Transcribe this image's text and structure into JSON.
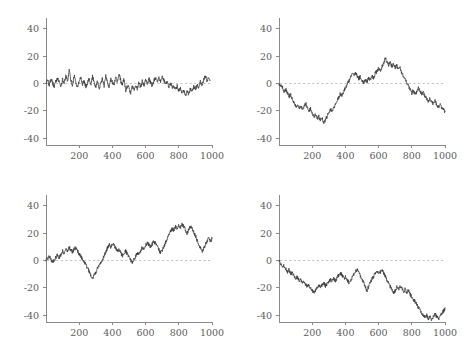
{
  "figure": {
    "background_color": "#ffffff",
    "layout": "2x2",
    "panel_count": 4
  },
  "style": {
    "axis_color": "#8a8a8a",
    "line_color": "#3b3b3b",
    "zero_line_color": "#b9b3b3",
    "tick_label_color": "#5d5d5d"
  },
  "chart_data": [
    {
      "type": "line",
      "title": "",
      "xlabel": "",
      "ylabel": "",
      "xlim": [
        0,
        1000
      ],
      "ylim": [
        -45,
        45
      ],
      "xticks": [
        200,
        400,
        600,
        800,
        1000
      ],
      "yticks": [
        -40,
        -20,
        0,
        20,
        40
      ],
      "xticklabels": [
        "200",
        "400",
        "600",
        "800",
        "1000"
      ],
      "yticklabels": [
        "-40",
        "-20",
        "0",
        "20",
        "40"
      ],
      "grid": false,
      "legend": false,
      "reference_line": {
        "y": 0,
        "style": "dashed"
      },
      "panel": "top-left",
      "description": "stationary white-noise-like series oscillating about zero",
      "series": [
        {
          "name": "series-1",
          "x": [
            0,
            10,
            20,
            30,
            40,
            50,
            60,
            70,
            80,
            90,
            100,
            110,
            120,
            130,
            140,
            150,
            160,
            170,
            180,
            190,
            200,
            210,
            220,
            230,
            240,
            250,
            260,
            270,
            280,
            290,
            300,
            310,
            320,
            330,
            340,
            350,
            360,
            370,
            380,
            390,
            400,
            410,
            420,
            430,
            440,
            450,
            460,
            470,
            480,
            490,
            500,
            510,
            520,
            530,
            540,
            550,
            560,
            570,
            580,
            590,
            600,
            610,
            620,
            630,
            640,
            650,
            660,
            670,
            680,
            690,
            700,
            710,
            720,
            730,
            740,
            750,
            760,
            770,
            780,
            790,
            800,
            810,
            820,
            830,
            840,
            850,
            860,
            870,
            880,
            890,
            900,
            910,
            920,
            930,
            940,
            950,
            960,
            970,
            980,
            990,
            1000
          ],
          "values": [
            0.5,
            2.2,
            -1.0,
            3.4,
            0.3,
            -2.1,
            1.8,
            4.2,
            0.9,
            -1.6,
            2.7,
            0.4,
            5.1,
            1.2,
            9.8,
            2.3,
            -1.4,
            6.2,
            0.6,
            -3.2,
            1.9,
            4.6,
            -0.8,
            2.1,
            -2.5,
            0.7,
            3.8,
            -1.2,
            4.9,
            1.5,
            -2.8,
            2.4,
            -4.1,
            0.2,
            3.1,
            -1.9,
            5.2,
            1.0,
            -2.2,
            3.6,
            0.8,
            -1.5,
            4.4,
            1.3,
            6.8,
            2.0,
            -0.9,
            3.3,
            -5.6,
            -1.8,
            -3.4,
            -6.9,
            -2.1,
            -4.8,
            -1.1,
            -3.7,
            0.4,
            -2.6,
            1.7,
            -1.3,
            2.9,
            -0.5,
            3.4,
            1.1,
            -1.7,
            2.2,
            4.3,
            0.6,
            3.9,
            1.4,
            5.0,
            2.6,
            -0.7,
            1.8,
            -2.4,
            0.3,
            -3.1,
            -1.6,
            -4.2,
            -2.0,
            -5.4,
            -3.3,
            -7.1,
            -4.6,
            -9.4,
            -5.2,
            -8.0,
            -3.8,
            -6.1,
            -2.3,
            -4.4,
            -0.9,
            -2.7,
            1.2,
            -1.4,
            3.0,
            5.8,
            1.9,
            4.1,
            0.7
          ]
        }
      ]
    },
    {
      "type": "line",
      "title": "",
      "xlabel": "",
      "ylabel": "",
      "xlim": [
        0,
        1000
      ],
      "ylim": [
        -45,
        45
      ],
      "xticks": [
        200,
        400,
        600,
        800,
        1000
      ],
      "yticks": [
        -40,
        -20,
        0,
        20,
        40
      ],
      "xticklabels": [
        "200",
        "400",
        "600",
        "800",
        "1000"
      ],
      "yticklabels": [
        "-40",
        "-20",
        "0",
        "20",
        "40"
      ],
      "grid": false,
      "legend": false,
      "reference_line": {
        "y": 0,
        "style": "dashed"
      },
      "panel": "top-right",
      "description": "random walk: dips to about -28 near x=250, rises to about +19 near x=640, ends near -20",
      "series": [
        {
          "name": "series-2",
          "x": [
            0,
            10,
            20,
            30,
            40,
            50,
            60,
            70,
            80,
            90,
            100,
            110,
            120,
            130,
            140,
            150,
            160,
            170,
            180,
            190,
            200,
            210,
            220,
            230,
            240,
            250,
            260,
            270,
            280,
            290,
            300,
            310,
            320,
            330,
            340,
            350,
            360,
            370,
            380,
            390,
            400,
            410,
            420,
            430,
            440,
            450,
            460,
            470,
            480,
            490,
            500,
            510,
            520,
            530,
            540,
            550,
            560,
            570,
            580,
            590,
            600,
            610,
            620,
            630,
            640,
            650,
            660,
            670,
            680,
            690,
            700,
            710,
            720,
            730,
            740,
            750,
            760,
            770,
            780,
            790,
            800,
            810,
            820,
            830,
            840,
            850,
            860,
            870,
            880,
            890,
            900,
            910,
            920,
            930,
            940,
            950,
            960,
            970,
            980,
            990,
            1000
          ],
          "values": [
            0.0,
            -1.5,
            -3.0,
            -5.5,
            -4.2,
            -7.0,
            -9.5,
            -8.2,
            -11.0,
            -13.5,
            -17.0,
            -15.2,
            -18.5,
            -16.0,
            -19.5,
            -17.2,
            -14.5,
            -16.8,
            -20.0,
            -18.5,
            -22.0,
            -24.5,
            -22.8,
            -26.0,
            -24.0,
            -27.0,
            -25.5,
            -28.5,
            -26.5,
            -24.0,
            -21.5,
            -19.0,
            -20.5,
            -17.5,
            -15.0,
            -12.5,
            -10.0,
            -7.5,
            -8.8,
            -5.5,
            -3.0,
            -1.0,
            1.5,
            4.0,
            7.0,
            5.5,
            8.5,
            6.0,
            3.5,
            5.0,
            2.0,
            0.5,
            3.0,
            1.0,
            4.5,
            2.5,
            6.0,
            4.0,
            7.5,
            9.0,
            11.0,
            9.5,
            12.5,
            15.0,
            18.5,
            16.0,
            13.5,
            15.5,
            12.0,
            14.0,
            11.5,
            13.0,
            10.0,
            11.5,
            8.0,
            5.5,
            3.0,
            0.5,
            -2.0,
            -4.5,
            -7.0,
            -5.0,
            -8.5,
            -6.0,
            -3.5,
            -5.5,
            -8.0,
            -6.5,
            -9.5,
            -11.5,
            -13.0,
            -11.0,
            -13.5,
            -15.0,
            -13.0,
            -15.5,
            -17.0,
            -15.5,
            -17.5,
            -19.0,
            -20.5
          ]
        }
      ]
    },
    {
      "type": "line",
      "title": "",
      "xlabel": "",
      "ylabel": "",
      "xlim": [
        0,
        1000
      ],
      "ylim": [
        -45,
        45
      ],
      "xticks": [
        200,
        400,
        600,
        800,
        1000
      ],
      "yticks": [
        -40,
        -20,
        0,
        20,
        40
      ],
      "xticklabels": [
        "200",
        "400",
        "600",
        "800",
        "1000"
      ],
      "yticklabels": [
        "-40",
        "-20",
        "0",
        "20",
        "40"
      ],
      "grid": false,
      "legend": false,
      "reference_line": {
        "y": 0,
        "style": "dashed"
      },
      "panel": "bottom-left",
      "description": "upward-drifting random walk: dips to about -13 near x=250, peaks near +27 around x=820, ends near +16",
      "series": [
        {
          "name": "series-3",
          "x": [
            0,
            10,
            20,
            30,
            40,
            50,
            60,
            70,
            80,
            90,
            100,
            110,
            120,
            130,
            140,
            150,
            160,
            170,
            180,
            190,
            200,
            210,
            220,
            230,
            240,
            250,
            260,
            270,
            280,
            290,
            300,
            310,
            320,
            330,
            340,
            350,
            360,
            370,
            380,
            390,
            400,
            410,
            420,
            430,
            440,
            450,
            460,
            470,
            480,
            490,
            500,
            510,
            520,
            530,
            540,
            550,
            560,
            570,
            580,
            590,
            600,
            610,
            620,
            630,
            640,
            650,
            660,
            670,
            680,
            690,
            700,
            710,
            720,
            730,
            740,
            750,
            760,
            770,
            780,
            790,
            800,
            810,
            820,
            830,
            840,
            850,
            860,
            870,
            880,
            890,
            900,
            910,
            920,
            930,
            940,
            950,
            960,
            970,
            980,
            990,
            1000
          ],
          "values": [
            0.0,
            1.5,
            3.0,
            1.0,
            -1.5,
            0.5,
            2.5,
            4.0,
            2.0,
            4.5,
            7.0,
            5.5,
            8.5,
            7.0,
            9.5,
            8.0,
            6.0,
            8.5,
            9.5,
            7.0,
            5.0,
            3.0,
            1.0,
            -1.0,
            -3.0,
            -5.5,
            -8.0,
            -10.5,
            -13.0,
            -11.0,
            -8.5,
            -6.0,
            -4.0,
            -1.5,
            1.0,
            3.5,
            6.0,
            9.0,
            11.5,
            10.0,
            12.5,
            11.0,
            9.0,
            6.5,
            8.0,
            5.5,
            3.5,
            5.0,
            7.0,
            4.5,
            2.0,
            0.0,
            -1.5,
            1.0,
            3.0,
            5.5,
            4.0,
            7.0,
            9.5,
            8.0,
            11.0,
            13.0,
            11.5,
            9.5,
            12.0,
            14.0,
            12.5,
            10.0,
            8.0,
            5.5,
            7.5,
            10.0,
            13.0,
            16.0,
            18.5,
            21.0,
            23.5,
            22.0,
            24.5,
            23.0,
            25.5,
            24.0,
            26.5,
            25.0,
            22.5,
            20.0,
            22.5,
            25.0,
            23.5,
            21.0,
            18.0,
            15.0,
            12.0,
            9.0,
            6.5,
            9.0,
            11.5,
            14.0,
            16.5,
            14.0,
            16.0
          ]
        }
      ]
    },
    {
      "type": "line",
      "title": "",
      "xlabel": "",
      "ylabel": "",
      "xlim": [
        0,
        1000
      ],
      "ylim": [
        -45,
        45
      ],
      "xticks": [
        200,
        400,
        600,
        800,
        1000
      ],
      "yticks": [
        -40,
        -20,
        0,
        20,
        40
      ],
      "xticklabels": [
        "200",
        "400",
        "600",
        "800",
        "1000"
      ],
      "yticklabels": [
        "-40",
        "-20",
        "0",
        "20",
        "40"
      ],
      "grid": false,
      "legend": false,
      "reference_line": {
        "y": 0,
        "style": "dashed"
      },
      "panel": "bottom-right",
      "description": "downward-drifting random walk: stays below zero throughout, reaching about -43 near x=900, ends near -35",
      "series": [
        {
          "name": "series-4",
          "x": [
            0,
            10,
            20,
            30,
            40,
            50,
            60,
            70,
            80,
            90,
            100,
            110,
            120,
            130,
            140,
            150,
            160,
            170,
            180,
            190,
            200,
            210,
            220,
            230,
            240,
            250,
            260,
            270,
            280,
            290,
            300,
            310,
            320,
            330,
            340,
            350,
            360,
            370,
            380,
            390,
            400,
            410,
            420,
            430,
            440,
            450,
            460,
            470,
            480,
            490,
            500,
            510,
            520,
            530,
            540,
            550,
            560,
            570,
            580,
            590,
            600,
            610,
            620,
            630,
            640,
            650,
            660,
            670,
            680,
            690,
            700,
            710,
            720,
            730,
            740,
            750,
            760,
            770,
            780,
            790,
            800,
            810,
            820,
            830,
            840,
            850,
            860,
            870,
            880,
            890,
            900,
            910,
            920,
            930,
            940,
            950,
            960,
            970,
            980,
            990,
            1000
          ],
          "values": [
            0.0,
            -2.0,
            -4.5,
            -3.0,
            -6.0,
            -8.5,
            -7.0,
            -10.0,
            -9.0,
            -11.5,
            -13.0,
            -12.0,
            -14.5,
            -13.5,
            -16.0,
            -15.0,
            -17.5,
            -19.0,
            -18.0,
            -20.5,
            -22.0,
            -23.5,
            -22.0,
            -20.0,
            -18.5,
            -20.0,
            -18.0,
            -16.5,
            -18.5,
            -17.0,
            -15.5,
            -14.0,
            -15.5,
            -13.5,
            -15.0,
            -12.5,
            -11.0,
            -9.0,
            -11.0,
            -13.0,
            -12.0,
            -14.0,
            -16.0,
            -14.5,
            -12.5,
            -10.5,
            -8.0,
            -6.5,
            -8.5,
            -11.0,
            -13.5,
            -16.0,
            -19.5,
            -22.0,
            -19.0,
            -16.0,
            -13.5,
            -11.5,
            -9.5,
            -8.0,
            -9.5,
            -8.5,
            -7.5,
            -9.0,
            -11.5,
            -14.0,
            -16.5,
            -19.0,
            -21.5,
            -24.0,
            -22.0,
            -19.5,
            -21.0,
            -19.0,
            -20.5,
            -22.5,
            -21.0,
            -23.5,
            -22.0,
            -24.5,
            -26.5,
            -28.5,
            -30.0,
            -32.5,
            -34.5,
            -36.5,
            -38.5,
            -40.0,
            -41.5,
            -40.0,
            -42.5,
            -41.0,
            -43.0,
            -41.5,
            -39.5,
            -41.0,
            -43.0,
            -41.5,
            -39.0,
            -37.0,
            -35.5,
            -34.5
          ]
        }
      ]
    }
  ]
}
